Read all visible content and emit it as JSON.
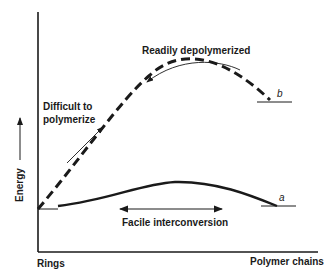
{
  "diagram": {
    "type": "energy-profile",
    "axes": {
      "y_label": "Energy",
      "y_arrow": "up-arrow",
      "x_left_label": "Rings",
      "x_right_label": "Polymer chains"
    },
    "curves": [
      {
        "id": "b",
        "label": "b",
        "style": "dashed",
        "description": "High-energy path, ring to polymer"
      },
      {
        "id": "a",
        "label": "a",
        "style": "solid",
        "description": "Low-energy path, ring to polymer"
      }
    ],
    "annotations": {
      "difficult_line1": "Difficult to",
      "difficult_line2": "polymerize",
      "readily": "Readily depolymerized",
      "facile": "Facile interconversion"
    },
    "colors": {
      "ink": "#1a1a1a",
      "background": "#ffffff"
    }
  }
}
